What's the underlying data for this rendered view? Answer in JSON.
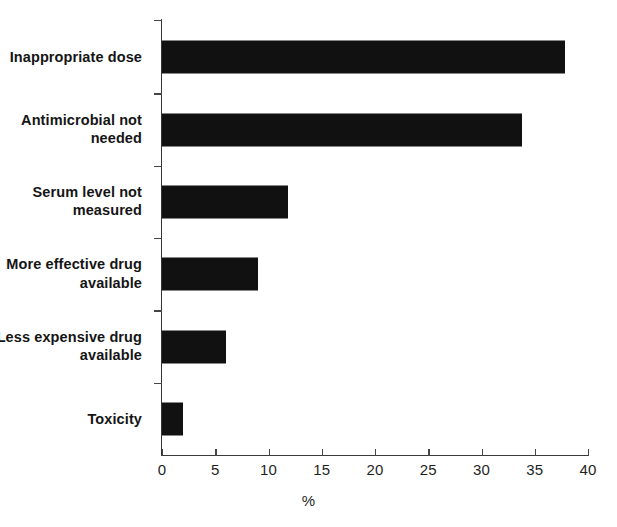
{
  "chart_data": {
    "type": "bar",
    "orientation": "horizontal",
    "title": "",
    "xlabel": "%",
    "ylabel": "",
    "xlim": [
      0,
      40
    ],
    "xticks": [
      0,
      5,
      10,
      15,
      20,
      25,
      30,
      35,
      40
    ],
    "xtick_labels": [
      "0",
      "5",
      "10",
      "15",
      "20",
      "25",
      "30",
      "35",
      "40"
    ],
    "grid": false,
    "legend": null,
    "bar_color": "#111111",
    "categories": [
      "Inappropriate dose",
      "Antimicrobial not needed",
      "Serum level not measured",
      "More effective drug available",
      "Less expensive drug available",
      "Toxicity"
    ],
    "values": [
      37.8,
      33.8,
      11.8,
      9.0,
      6.0,
      2.0
    ],
    "series": [
      {
        "name": "",
        "values": [
          37.8,
          33.8,
          11.8,
          9.0,
          6.0,
          2.0
        ]
      }
    ]
  },
  "axis": {
    "x_title": "%"
  }
}
